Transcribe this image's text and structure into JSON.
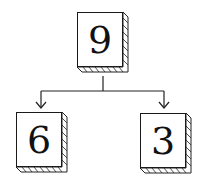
{
  "diagram": {
    "type": "tree",
    "root": {
      "label": "9"
    },
    "children": [
      {
        "label": "6"
      },
      {
        "label": "3"
      }
    ],
    "colors": {
      "stroke": "#1a1a1a",
      "fill": "#ffffff"
    }
  }
}
